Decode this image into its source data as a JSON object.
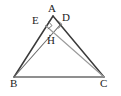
{
  "figure": {
    "kind": "geometry-diagram",
    "canvas": {
      "width": 121,
      "height": 96
    },
    "colors": {
      "stroke_dark": "#3a3a3a",
      "stroke_mid": "#6b6b6b",
      "stroke_light": "#9a9a9a",
      "label": "#1c1c1c",
      "background": "#ffffff"
    },
    "points": {
      "A": {
        "label": "A",
        "x": 53,
        "y": 16,
        "label_x": 48,
        "label_y": 3
      },
      "B": {
        "label": "B",
        "x": 14,
        "y": 77,
        "label_x": 10,
        "label_y": 78
      },
      "C": {
        "label": "C",
        "x": 104,
        "y": 77,
        "label_x": 100,
        "label_y": 78
      },
      "D": {
        "label": "D",
        "x": 60.5,
        "y": 24.5,
        "label_x": 62,
        "label_y": 12
      },
      "E": {
        "label": "E",
        "x": 45.5,
        "y": 25.5,
        "label_x": 32,
        "label_y": 15
      },
      "H": {
        "label": "H",
        "x": 50,
        "y": 35.5,
        "label_x": 47,
        "label_y": 35
      }
    },
    "segments": [
      {
        "name": "side-AB",
        "from": "A",
        "to": "B",
        "weight": 1.5,
        "shade": "stroke_dark"
      },
      {
        "name": "side-AC",
        "from": "A",
        "to": "C",
        "weight": 1.5,
        "shade": "stroke_dark"
      },
      {
        "name": "side-BC",
        "from": "B",
        "to": "C",
        "weight": 1.5,
        "shade": "stroke_mid"
      },
      {
        "name": "altitude-BD",
        "from": "B",
        "to": "D",
        "weight": 1.1,
        "shade": "stroke_mid"
      },
      {
        "name": "altitude-CE",
        "from": "C",
        "to": "E",
        "weight": 1.1,
        "shade": "stroke_light"
      }
    ],
    "right_angles": [
      {
        "name": "right-angle-at-D",
        "vertex": "D",
        "size": 5
      },
      {
        "name": "right-angle-at-E",
        "vertex": "E",
        "size": 5
      }
    ],
    "notes": {
      "orthocenter": "H",
      "foot_on_AC": "D",
      "foot_on_AB": "E"
    }
  }
}
